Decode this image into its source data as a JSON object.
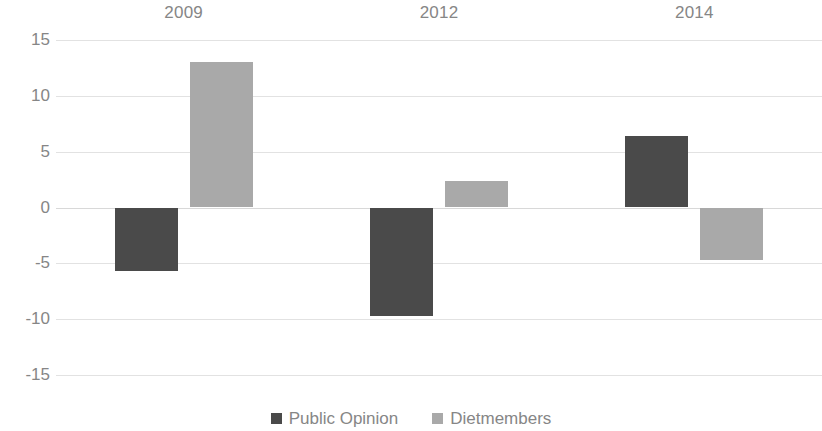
{
  "chart_data": {
    "type": "bar",
    "title": "",
    "subtitle": "",
    "xlabel": "",
    "ylabel": "",
    "categories": [
      "2009",
      "2012",
      "2014"
    ],
    "series": [
      {
        "name": "Public Opinion",
        "color": "#4a4a4a",
        "values": [
          -5.7,
          -9.7,
          6.4
        ]
      },
      {
        "name": "Dietmembers",
        "color": "#a9a9a9",
        "values": [
          13.0,
          2.4,
          -4.7
        ]
      }
    ],
    "ylim": [
      -15,
      15
    ],
    "yticks": [
      15,
      10,
      5,
      0,
      -5,
      -10,
      -15
    ],
    "ytick_labels": [
      "15",
      "10",
      "5",
      "0",
      "-5",
      "-10",
      "-15"
    ],
    "grid": true,
    "grid_color": "#e2e2e2",
    "legend_position": "bottom",
    "category_label_position": "top",
    "axis_text_color": "#868686",
    "background": "#ffffff"
  }
}
